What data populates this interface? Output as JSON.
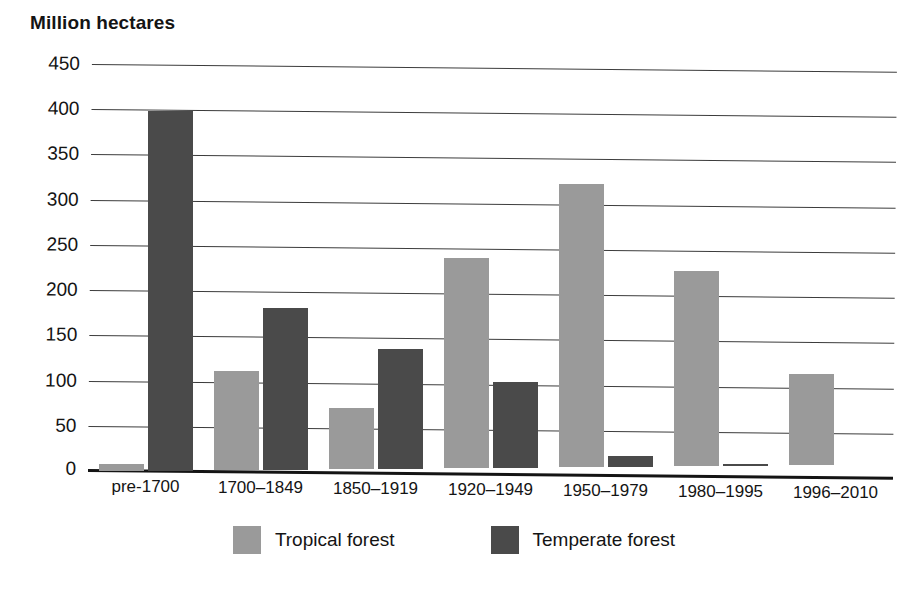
{
  "chart_data": {
    "type": "bar",
    "title": "",
    "ylabel": "Million hectares",
    "xlabel": "",
    "ylim": [
      0,
      450
    ],
    "ytick_step": 50,
    "yticks": [
      450,
      400,
      350,
      300,
      250,
      200,
      150,
      100,
      50,
      0
    ],
    "grid": true,
    "legend_position": "bottom",
    "categories": [
      "pre-1700",
      "1700–1849",
      "1850–1919",
      "1920–1949",
      "1950–1979",
      "1980–1995",
      "1996–2010"
    ],
    "series": [
      {
        "name": "Tropical forest",
        "color": "#9a9a9a",
        "values": [
          8,
          110,
          68,
          232,
          313,
          215,
          100
        ]
      },
      {
        "name": "Temperate forest",
        "color": "#4a4a4a",
        "values": [
          399,
          180,
          133,
          95,
          12,
          2,
          0
        ]
      }
    ]
  },
  "legend": {
    "items": [
      {
        "label": "Tropical forest",
        "swatch": "tropical"
      },
      {
        "label": "Temperate forest",
        "swatch": "temperate"
      }
    ]
  },
  "colors": {
    "tropical": "#9a9a9a",
    "temperate": "#4a4a4a",
    "axis": "#141414",
    "gridline": "#3c3c3c",
    "background": "#ffffff"
  }
}
